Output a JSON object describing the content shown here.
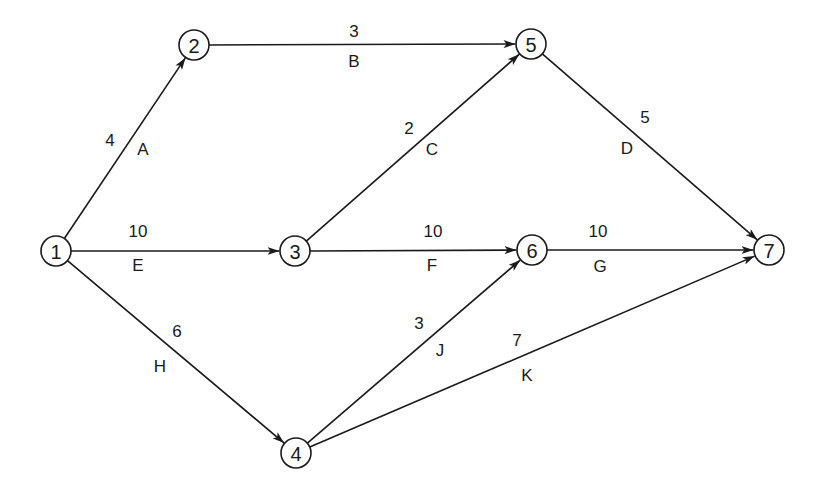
{
  "diagram": {
    "type": "activity-on-arrow network",
    "nodes": [
      {
        "id": "1",
        "label": "1",
        "x": 56,
        "y": 251
      },
      {
        "id": "2",
        "label": "2",
        "x": 194,
        "y": 45
      },
      {
        "id": "3",
        "label": "3",
        "x": 295,
        "y": 251
      },
      {
        "id": "4",
        "label": "4",
        "x": 296,
        "y": 453
      },
      {
        "id": "5",
        "label": "5",
        "x": 531,
        "y": 44
      },
      {
        "id": "6",
        "label": "6",
        "x": 532,
        "y": 250
      },
      {
        "id": "7",
        "label": "7",
        "x": 769,
        "y": 250
      }
    ],
    "edges": [
      {
        "from": "1",
        "to": "2",
        "activity": "A",
        "duration": "4",
        "dur_pos": [
          110,
          140
        ],
        "act_pos": [
          143,
          149
        ]
      },
      {
        "from": "2",
        "to": "5",
        "activity": "B",
        "duration": "3",
        "dur_pos": [
          354,
          31
        ],
        "act_pos": [
          354,
          61
        ]
      },
      {
        "from": "3",
        "to": "5",
        "activity": "C",
        "duration": "2",
        "dur_pos": [
          409,
          128
        ],
        "act_pos": [
          432,
          149
        ]
      },
      {
        "from": "5",
        "to": "7",
        "activity": "D",
        "duration": "5",
        "dur_pos": [
          645,
          117
        ],
        "act_pos": [
          627,
          148
        ]
      },
      {
        "from": "1",
        "to": "3",
        "activity": "E",
        "duration": "10",
        "dur_pos": [
          138,
          231
        ],
        "act_pos": [
          138,
          265
        ]
      },
      {
        "from": "3",
        "to": "6",
        "activity": "F",
        "duration": "10",
        "dur_pos": [
          433,
          231
        ],
        "act_pos": [
          432,
          265
        ]
      },
      {
        "from": "6",
        "to": "7",
        "activity": "G",
        "duration": "10",
        "dur_pos": [
          598,
          231
        ],
        "act_pos": [
          600,
          266
        ]
      },
      {
        "from": "1",
        "to": "4",
        "activity": "H",
        "duration": "6",
        "dur_pos": [
          177,
          331
        ],
        "act_pos": [
          160,
          366
        ]
      },
      {
        "from": "4",
        "to": "6",
        "activity": "J",
        "duration": "3",
        "dur_pos": [
          419,
          323
        ],
        "act_pos": [
          440,
          350
        ]
      },
      {
        "from": "4",
        "to": "7",
        "activity": "K",
        "duration": "7",
        "dur_pos": [
          517,
          340
        ],
        "act_pos": [
          527,
          375
        ]
      }
    ],
    "node_radius": 15,
    "colors": {
      "stroke": "#1a1a1a",
      "background": "#ffffff"
    }
  }
}
